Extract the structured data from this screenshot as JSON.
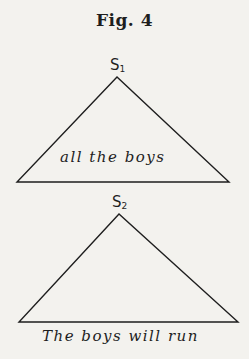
{
  "figure": {
    "title": "Fig. 4"
  },
  "trees": [
    {
      "node": "S",
      "subscript": "1",
      "phrase": "all the boys",
      "apex": [
        117,
        77
      ],
      "base_left": [
        17,
        182
      ],
      "base_right": [
        229,
        182
      ]
    },
    {
      "node": "S",
      "subscript": "2",
      "phrase": "The boys will run",
      "apex": [
        119,
        214
      ],
      "base_left": [
        19,
        322
      ],
      "base_right": [
        238,
        322
      ]
    }
  ],
  "colors": {
    "background": "#f3f2ee",
    "ink": "#1e1e1e"
  }
}
